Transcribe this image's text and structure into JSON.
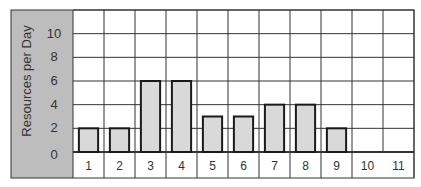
{
  "chart_data": {
    "type": "bar",
    "title": "",
    "xlabel": "",
    "ylabel": "Resources per Day",
    "categories": [
      "1",
      "2",
      "3",
      "4",
      "5",
      "6",
      "7",
      "8",
      "9",
      "10",
      "11"
    ],
    "values": [
      2,
      2,
      6,
      6,
      3,
      3,
      4,
      4,
      2,
      0,
      0
    ],
    "yticks": [
      0,
      2,
      4,
      6,
      8,
      10
    ],
    "ylim": [
      0,
      12
    ],
    "grid": true,
    "legend": null,
    "colors": {
      "bar_fill": "#d9d9d9",
      "bar_stroke": "#1a1a1a",
      "axis_panel": "#bdbdbd",
      "grid": "#333333"
    }
  }
}
